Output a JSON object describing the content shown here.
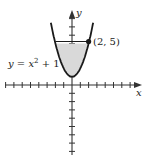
{
  "figure": {
    "curve_label_prefix": "y = x",
    "curve_label_exp": "2",
    "curve_label_suffix": " + 1",
    "point_label": "(2, 5)",
    "x_axis_label": "x",
    "y_axis_label": "y"
  },
  "chart_data": {
    "type": "diagram",
    "function": "y = x^2 + 1",
    "shaded_region": {
      "description": "region between parabola and line y = 5",
      "x_range": [
        -2,
        2
      ],
      "y_top": 5
    },
    "marked_point": {
      "x": 2,
      "y": 5,
      "label": "(2, 5)"
    },
    "axes": {
      "x_label": "x",
      "y_label": "y",
      "x_range": [
        -8,
        8
      ],
      "y_range": [
        -9,
        9
      ],
      "tick_spacing": 1
    },
    "colors": {
      "shade": "#d9d9d9",
      "curve": "#1a1a1a",
      "axis": "#333333"
    }
  }
}
